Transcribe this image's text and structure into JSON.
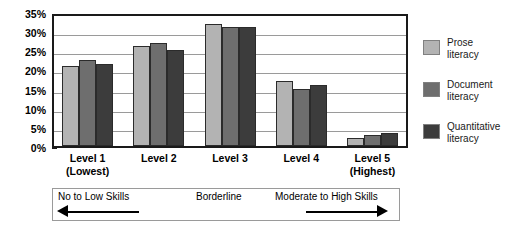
{
  "chart_data": {
    "type": "bar",
    "title": "",
    "xlabel": "",
    "ylabel": "",
    "ylim": [
      0,
      35
    ],
    "grid": true,
    "legend_position": "right",
    "categories": [
      "Level 1\n(Lowest)",
      "Level 2",
      "Level 3",
      "Level 4",
      "Level 5\n(Highest)"
    ],
    "category_lines": [
      {
        "line1": "Level 1",
        "line2": "(Lowest)"
      },
      {
        "line1": "Level 2",
        "line2": ""
      },
      {
        "line1": "Level 3",
        "line2": ""
      },
      {
        "line1": "Level 4",
        "line2": ""
      },
      {
        "line1": "Level 5",
        "line2": "(Highest)"
      }
    ],
    "ytick_labels": [
      "0%",
      "5%",
      "10%",
      "15%",
      "20%",
      "25%",
      "30%",
      "35%"
    ],
    "ytick_values": [
      0,
      5,
      10,
      15,
      20,
      25,
      30,
      35
    ],
    "series": [
      {
        "name": "Prose literacy",
        "name_line1": "Prose",
        "name_line2": "literacy",
        "color": "#b3b3b3",
        "values": [
          21,
          26,
          32,
          17,
          2
        ]
      },
      {
        "name": "Document literacy",
        "name_line1": "Document",
        "name_line2": "literacy",
        "color": "#6e6e6e",
        "values": [
          22.5,
          27,
          31,
          15,
          3
        ]
      },
      {
        "name": "Quantitative literacy",
        "name_line1": "Quantitative",
        "name_line2": "literacy",
        "color": "#3c3c3c",
        "values": [
          21.5,
          25,
          31,
          16,
          3.5
        ]
      }
    ],
    "annotations": {
      "low": "No to Low Skills",
      "mid": "Borderline",
      "high": "Moderate to High Skills",
      "left_arrow": "left-arrow",
      "right_arrow": "right-arrow"
    }
  }
}
